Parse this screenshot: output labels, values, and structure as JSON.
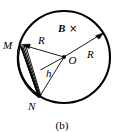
{
  "figure": {
    "caption": "(b)",
    "background_color": "#ffffff",
    "stroke_color": "#000000",
    "labels": {
      "field": "B",
      "field_direction_symbol": "×",
      "radius_left": "R",
      "radius_right": "R",
      "height": "h",
      "center": "O",
      "point_m": "M",
      "point_n": "N"
    },
    "geometry": {
      "circle": {
        "cx": 64,
        "cy": 57,
        "r": 46
      },
      "center_dot": {
        "cx": 64,
        "cy": 57,
        "r": 1.8
      },
      "point_m": {
        "x": 20.5,
        "y": 45.5
      },
      "point_n": {
        "x": 39.0,
        "y": 97.5
      },
      "chord_foot": {
        "x": 40.5,
        "y": 70.0
      },
      "radius_right_tip": {
        "x": 103.0,
        "y": 33.0
      }
    },
    "label_positions": {
      "field": {
        "x": 58,
        "y": 32
      },
      "field_direction_symbol": {
        "x": 70,
        "y": 32
      },
      "radius_left": {
        "x": 38,
        "y": 44
      },
      "radius_right": {
        "x": 87,
        "y": 58
      },
      "height": {
        "x": 47,
        "y": 77
      },
      "center": {
        "x": 69,
        "y": 63
      },
      "point_m": {
        "x": 4,
        "y": 48
      },
      "point_n": {
        "x": 29,
        "y": 110
      },
      "caption": {
        "x": 62,
        "y": 128
      }
    }
  }
}
